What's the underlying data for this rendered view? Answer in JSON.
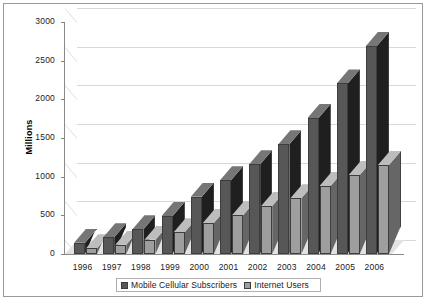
{
  "chart_data": {
    "type": "bar",
    "title": "",
    "xlabel": "",
    "ylabel": "Millions",
    "ylim": [
      0,
      3000
    ],
    "ytick_values": [
      0,
      500,
      1000,
      1500,
      2000,
      2500,
      3000
    ],
    "ytick_labels": [
      "0",
      "500",
      "1000",
      "1500",
      "2000",
      "2500",
      "3000"
    ],
    "grid": true,
    "legend_position": "bottom",
    "style": "3d-column",
    "categories": [
      "1996",
      "1997",
      "1998",
      "1999",
      "2000",
      "2001",
      "2002",
      "2003",
      "2004",
      "2005",
      "2006"
    ],
    "series": [
      {
        "name": "Mobile Cellular Subscribers",
        "color": "#575757",
        "values": [
          145,
          215,
          320,
          490,
          740,
          955,
          1160,
          1420,
          1760,
          2205,
          2690
        ]
      },
      {
        "name": "Internet Users",
        "color": "#9e9e9e",
        "values": [
          75,
          120,
          185,
          280,
          400,
          500,
          620,
          720,
          880,
          1020,
          1150
        ]
      }
    ]
  },
  "legend": {
    "items": [
      {
        "label": "Mobile Cellular Subscribers",
        "color": "#575757"
      },
      {
        "label": "Internet Users",
        "color": "#9e9e9e"
      }
    ]
  },
  "colors": {
    "series_mobile": "#575757",
    "series_internet": "#9e9e9e",
    "gridline": "#d8d8d8",
    "axis": "#8a8a8a",
    "frame_border": "#9a9a9a",
    "floor": "#e2e2e2",
    "text": "#1a1a1a"
  }
}
